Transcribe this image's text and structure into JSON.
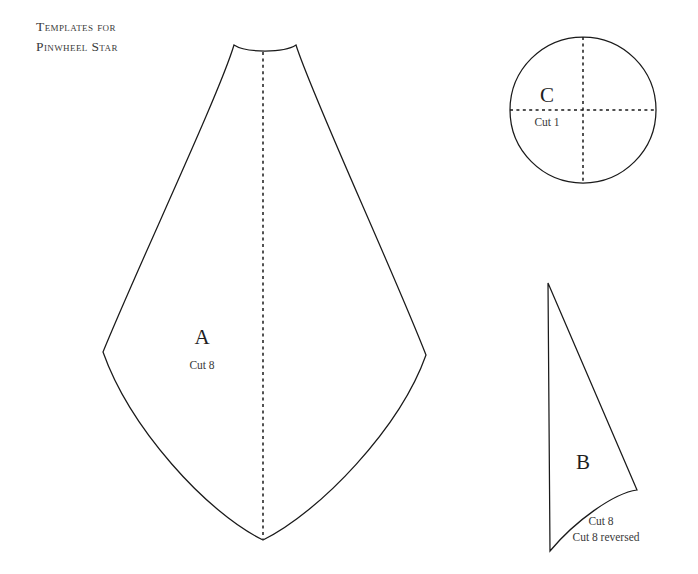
{
  "page": {
    "background_color": "#ffffff",
    "ink_color": "#1a1a1a",
    "width": 698,
    "height": 574
  },
  "title": {
    "line1": "Templates for",
    "line2": "Pinwheel Star"
  },
  "pieces": [
    {
      "id": "A",
      "letter": "A",
      "cut_note": "Cut 8",
      "shape": "kite-petal",
      "has_fold_line": true
    },
    {
      "id": "C",
      "letter": "C",
      "cut_note": "Cut 1",
      "shape": "circle",
      "has_fold_line": true
    },
    {
      "id": "B",
      "letter": "B",
      "cut_note": "Cut 8",
      "cut_note_2": "Cut 8 reversed",
      "shape": "curved-triangle",
      "has_fold_line": false
    }
  ],
  "geometry": {
    "piece_a": {
      "top_left_peak": [
        234,
        45
      ],
      "top_right_peak": [
        296,
        45
      ],
      "left_vertex": [
        103,
        352
      ],
      "right_vertex": [
        426,
        355
      ],
      "bottom_point": [
        263,
        540
      ],
      "fold_line": [
        [
          263,
          52
        ],
        [
          263,
          540
        ]
      ]
    },
    "piece_c": {
      "center": [
        583,
        110
      ],
      "radius": 73
    },
    "piece_b": {
      "apex": [
        548,
        283
      ],
      "bottom_left": [
        550,
        551
      ],
      "right_corner": [
        637,
        490
      ]
    }
  }
}
